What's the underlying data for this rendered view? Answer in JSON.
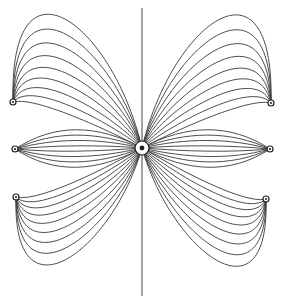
{
  "diagram": {
    "type": "electric-field-lines",
    "colors": {
      "line": "#3a3a3a",
      "charge": "#222222",
      "background": "#ffffff"
    },
    "axis": {
      "x": 142,
      "y1": 8,
      "y2": 296
    },
    "center_charge": {
      "x": 142,
      "y": 148,
      "r": 7,
      "symbol": "⊗"
    },
    "outer_charges": [
      {
        "id": "left-top",
        "x": 13,
        "y": 102,
        "lines": 9,
        "bulge": "up"
      },
      {
        "id": "left-middle",
        "x": 15,
        "y": 149,
        "lines": 8,
        "bulge": "flat"
      },
      {
        "id": "left-bottom",
        "x": 16,
        "y": 197,
        "lines": 9,
        "bulge": "down"
      },
      {
        "id": "right-top",
        "x": 271,
        "y": 103,
        "lines": 9,
        "bulge": "up"
      },
      {
        "id": "right-middle",
        "x": 270,
        "y": 149,
        "lines": 8,
        "bulge": "flat"
      },
      {
        "id": "right-bottom",
        "x": 266,
        "y": 199,
        "lines": 9,
        "bulge": "down"
      }
    ]
  }
}
